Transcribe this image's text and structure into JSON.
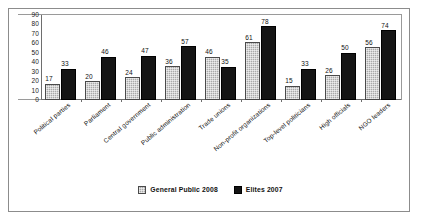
{
  "chart_data": {
    "type": "bar",
    "title": "",
    "subtitle": "",
    "xlabel": "",
    "ylabel": "",
    "ylim": [
      0,
      90
    ],
    "yticks": [
      90,
      80,
      70,
      60,
      50,
      40,
      30,
      20,
      10,
      0
    ],
    "grid": false,
    "legend_position": "bottom-center",
    "orientation": "vertical",
    "grouping": "grouped",
    "data_labels": true,
    "categories": [
      "Political parties",
      "Parliament",
      "Central government",
      "Public administration",
      "Trade unions",
      "Non-profit organizations",
      "Top-level politicians",
      "High officials",
      "NGO leaders"
    ],
    "series": [
      {
        "name": "General Public 2008",
        "color": "#a9a9a9",
        "values": [
          17,
          20,
          24,
          36,
          46,
          61,
          15,
          26,
          56
        ]
      },
      {
        "name": "Elites 2007",
        "color": "#141414",
        "values": [
          33,
          46,
          47,
          57,
          35,
          78,
          33,
          50,
          74
        ]
      }
    ]
  },
  "legend": {
    "items": [
      {
        "label": "General Public 2008",
        "swatch": "gray-pattern-swatch"
      },
      {
        "label": "Elites 2007",
        "swatch": "black-swatch"
      }
    ]
  }
}
